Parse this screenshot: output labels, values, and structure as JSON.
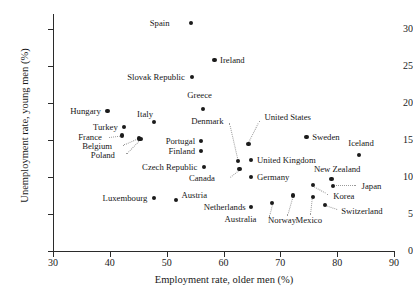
{
  "chart_data": {
    "type": "scatter",
    "title": "",
    "xlabel": "Employment rate, older men (%)",
    "ylabel": "Unemployment rate, young men (%)",
    "xlim": [
      30,
      90
    ],
    "ylim": [
      0,
      32
    ],
    "xticks": [
      30,
      40,
      50,
      60,
      70,
      80,
      90
    ],
    "yticks": [
      0,
      5,
      10,
      15,
      20,
      25,
      30
    ],
    "grid": false,
    "legend": "none",
    "point_color": "#1b1b1b",
    "points": [
      {
        "label": "Spain",
        "x": 54.3,
        "y": 30.8,
        "label_pos": "r",
        "lx": 50.5,
        "ly": 30.8
      },
      {
        "label": "Ireland",
        "x": 58.4,
        "y": 25.8,
        "label_pos": "l",
        "lx": 59.4,
        "ly": 25.8
      },
      {
        "label": "Slovak Republic",
        "x": 54.4,
        "y": 23.5,
        "label_pos": "r",
        "lx": 53.2,
        "ly": 23.5
      },
      {
        "label": "Greece",
        "x": 56.4,
        "y": 19.2,
        "label_pos": "c",
        "lx": 55.8,
        "ly": 21.0
      },
      {
        "label": "Hungary",
        "x": 39.6,
        "y": 18.9,
        "label_pos": "r",
        "lx": 38.4,
        "ly": 18.9
      },
      {
        "label": "Italy",
        "x": 47.7,
        "y": 17.4,
        "label_pos": "c",
        "lx": 46.2,
        "ly": 18.5
      },
      {
        "label": "Turkey",
        "x": 42.5,
        "y": 16.7,
        "label_pos": "r",
        "lx": 41.4,
        "ly": 16.7
      },
      {
        "label": "France",
        "x": 42.2,
        "y": 15.6,
        "label_pos": "r",
        "lx": 38.6,
        "ly": 15.4
      },
      {
        "label": "Belgium",
        "x": 45.2,
        "y": 15.2,
        "label_pos": "r",
        "lx": 40.4,
        "ly": 14.2
      },
      {
        "label": "Poland",
        "x": 45.4,
        "y": 15.1,
        "label_pos": "r",
        "lx": 40.9,
        "ly": 12.9
      },
      {
        "label": "Portugal",
        "x": 56.0,
        "y": 14.9,
        "label_pos": "r",
        "lx": 55.0,
        "ly": 14.9
      },
      {
        "label": "United States",
        "x": 64.4,
        "y": 14.4,
        "label_pos": "l",
        "lx": 67.2,
        "ly": 18.1
      },
      {
        "label": "Sweden",
        "x": 74.6,
        "y": 15.4,
        "label_pos": "l",
        "lx": 75.6,
        "ly": 15.4
      },
      {
        "label": "Iceland",
        "x": 83.8,
        "y": 13.0,
        "label_pos": "c",
        "lx": 84.2,
        "ly": 14.6
      },
      {
        "label": "Finland",
        "x": 56.0,
        "y": 13.5,
        "label_pos": "r",
        "lx": 55.0,
        "ly": 13.5
      },
      {
        "label": "Denmark",
        "x": 62.5,
        "y": 12.2,
        "label_pos": "r",
        "lx": 60.0,
        "ly": 17.6
      },
      {
        "label": "United Kingdom",
        "x": 64.9,
        "y": 12.3,
        "label_pos": "l",
        "lx": 65.9,
        "ly": 12.3
      },
      {
        "label": "Czech Republic",
        "x": 56.5,
        "y": 11.3,
        "label_pos": "r",
        "lx": 55.4,
        "ly": 11.3
      },
      {
        "label": "Canada",
        "x": 62.8,
        "y": 11.1,
        "label_pos": "r",
        "lx": 58.5,
        "ly": 9.9
      },
      {
        "label": "Germany",
        "x": 64.9,
        "y": 10.0,
        "label_pos": "l",
        "lx": 65.9,
        "ly": 10.0
      },
      {
        "label": "New Zealand",
        "x": 79.0,
        "y": 9.7,
        "label_pos": "c",
        "lx": 80.0,
        "ly": 11.1
      },
      {
        "label": "Japan",
        "x": 79.3,
        "y": 8.8,
        "label_pos": "l",
        "lx": 84.3,
        "ly": 8.8
      },
      {
        "label": "Korea",
        "x": 75.7,
        "y": 8.9,
        "label_pos": "l",
        "lx": 79.3,
        "ly": 7.4
      },
      {
        "label": "Switzerland",
        "x": 77.8,
        "y": 6.2,
        "label_pos": "l",
        "lx": 80.7,
        "ly": 5.4
      },
      {
        "label": "Luxembourg",
        "x": 47.7,
        "y": 7.2,
        "label_pos": "r",
        "lx": 46.6,
        "ly": 7.2
      },
      {
        "label": "Austria",
        "x": 51.6,
        "y": 6.9,
        "label_pos": "l",
        "lx": 52.6,
        "ly": 7.6
      },
      {
        "label": "Netherlands",
        "x": 64.9,
        "y": 5.9,
        "label_pos": "r",
        "lx": 63.9,
        "ly": 5.9
      },
      {
        "label": "Australia",
        "x": 68.6,
        "y": 6.5,
        "label_pos": "r",
        "lx": 65.8,
        "ly": 4.3
      },
      {
        "label": "Norway",
        "x": 72.2,
        "y": 7.5,
        "label_pos": "c",
        "lx": 70.3,
        "ly": 4.2
      },
      {
        "label": "Mexico",
        "x": 75.7,
        "y": 7.3,
        "label_pos": "c",
        "lx": 75.0,
        "ly": 4.2
      }
    ],
    "leaders": [
      {
        "from_label": "France",
        "x1": 39.8,
        "y1": 15.4,
        "x2": 42.0,
        "y2": 15.6
      },
      {
        "from_label": "Belgium",
        "x1": 42.4,
        "y1": 14.3,
        "x2": 45.0,
        "y2": 15.2
      },
      {
        "from_label": "Poland",
        "x1": 42.8,
        "y1": 13.1,
        "x2": 45.2,
        "y2": 15.0
      },
      {
        "from_label": "Denmark",
        "x1": 61.1,
        "y1": 17.3,
        "x2": 62.5,
        "y2": 12.6
      },
      {
        "from_label": "United States",
        "x1": 66.5,
        "y1": 17.6,
        "x2": 64.6,
        "y2": 14.7
      },
      {
        "from_label": "Canada",
        "x1": 61.2,
        "y1": 10.0,
        "x2": 62.7,
        "y2": 10.9
      },
      {
        "from_label": "Japan",
        "x1": 83.3,
        "y1": 8.8,
        "x2": 79.8,
        "y2": 8.8
      },
      {
        "from_label": "Korea",
        "x1": 78.4,
        "y1": 7.6,
        "x2": 76.0,
        "y2": 8.6
      },
      {
        "from_label": "Switzerland",
        "x1": 80.0,
        "y1": 5.5,
        "x2": 78.1,
        "y2": 6.0
      },
      {
        "from_label": "Australia",
        "x1": 68.0,
        "y1": 4.6,
        "x2": 68.5,
        "y2": 6.2
      },
      {
        "from_label": "Norway",
        "x1": 71.2,
        "y1": 4.7,
        "x2": 72.1,
        "y2": 7.1
      },
      {
        "from_label": "Mexico",
        "x1": 75.3,
        "y1": 4.8,
        "x2": 75.6,
        "y2": 7.0
      }
    ]
  }
}
